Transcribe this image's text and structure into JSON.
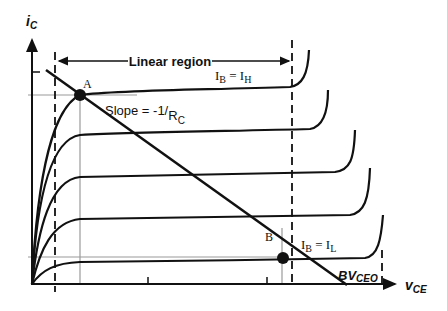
{
  "diagram": {
    "y_axis_label": "i",
    "y_axis_sub": "C",
    "x_axis_label": "v",
    "x_axis_sub": "CE",
    "region_label": "Linear region",
    "point_a": "A",
    "point_b": "B",
    "slope_label_main": "Slope = -1/",
    "slope_label_r": "R",
    "slope_label_sub": "C",
    "ib_high_main": "I",
    "ib_high_sub1": "B",
    "ib_high_eq": " = I",
    "ib_high_sub2": "H",
    "ib_low_main": "I",
    "ib_low_sub1": "B",
    "ib_low_eq": " = I",
    "ib_low_sub2": "L",
    "bv_label": "BV",
    "bv_sub": "CEO",
    "curve_count": 5,
    "colors": {
      "ink": "#111111",
      "guide": "#9a9a9a"
    }
  }
}
